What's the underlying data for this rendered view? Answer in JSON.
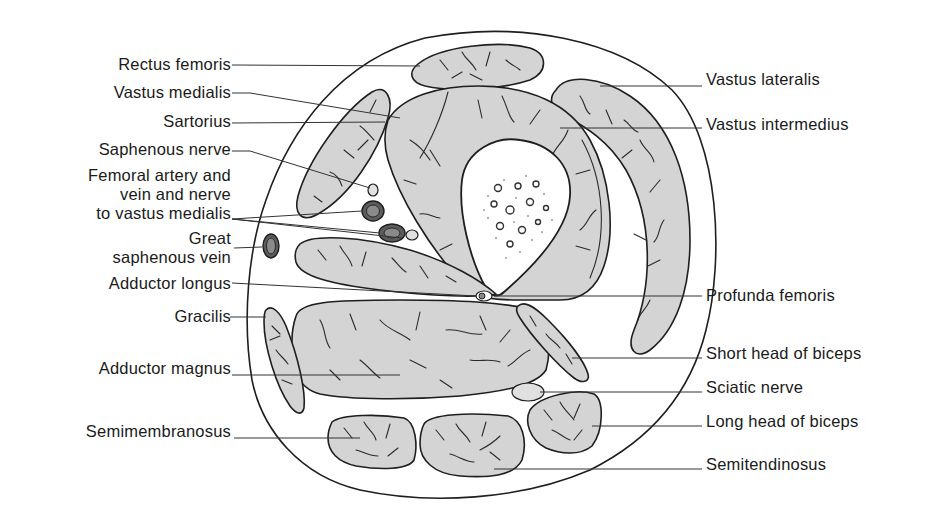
{
  "figure": {
    "colors": {
      "muscle_fill": "#d4d4d4",
      "outline": "#1e1e1e",
      "vessel_fill": "#5c5c5c",
      "bone_fill": "#ffffff",
      "background": "#ffffff"
    }
  },
  "labels": {
    "left": [
      {
        "id": "rectus-femoris",
        "text": "Rectus femoris"
      },
      {
        "id": "vastus-medialis",
        "text": "Vastus medialis"
      },
      {
        "id": "sartorius",
        "text": "Sartorius"
      },
      {
        "id": "saphenous-nerve",
        "text": "Saphenous nerve"
      },
      {
        "id": "femoral-vessels",
        "lines": [
          "Femoral artery and",
          "vein and nerve",
          "to vastus medialis"
        ]
      },
      {
        "id": "great-saphenous-vein",
        "lines": [
          "Great",
          "saphenous vein"
        ]
      },
      {
        "id": "adductor-longus",
        "text": "Adductor longus"
      },
      {
        "id": "gracilis",
        "text": "Gracilis"
      },
      {
        "id": "adductor-magnus",
        "text": "Adductor magnus"
      },
      {
        "id": "semimembranosus",
        "text": "Semimembranosus"
      }
    ],
    "right": [
      {
        "id": "vastus-lateralis",
        "text": "Vastus lateralis"
      },
      {
        "id": "vastus-intermedius",
        "text": "Vastus intermedius"
      },
      {
        "id": "profunda-femoris",
        "text": "Profunda femoris"
      },
      {
        "id": "short-head-biceps",
        "text": "Short head of biceps"
      },
      {
        "id": "sciatic-nerve",
        "text": "Sciatic nerve"
      },
      {
        "id": "long-head-biceps",
        "text": "Long head of biceps"
      },
      {
        "id": "semitendinosus",
        "text": "Semitendinosus"
      }
    ]
  }
}
